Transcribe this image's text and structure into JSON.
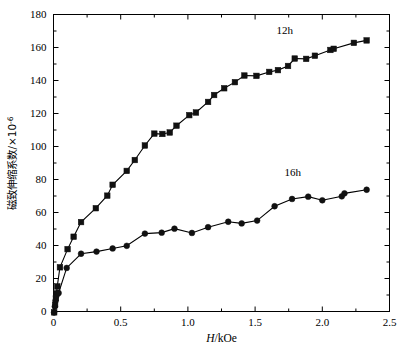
{
  "chart_data": {
    "type": "line",
    "title": "",
    "xlabel": "H/kOe",
    "ylabel": "磁致伸缩系数/×10⁻⁶",
    "ylabel_parts": {
      "cjk": "磁致伸缩系数",
      "separator": "/",
      "multiplier": "×10",
      "exponent": "-6"
    },
    "xlabel_parts": {
      "symbol": "H",
      "separator": "/",
      "unit": "kOe"
    },
    "xlim": [
      0,
      2.5
    ],
    "ylim": [
      0,
      180
    ],
    "xticks": [
      0,
      0.5,
      1.0,
      1.5,
      2.0,
      2.5
    ],
    "xtick_labels": [
      "0",
      "0.5",
      "1.0",
      "1.5",
      "2.0",
      "2.5"
    ],
    "yticks": [
      0,
      20,
      40,
      60,
      80,
      100,
      120,
      140,
      160,
      180
    ],
    "ytick_labels": [
      "0",
      "20",
      "40",
      "60",
      "80",
      "100",
      "120",
      "140",
      "160",
      "180"
    ],
    "x_minor_ticks": [
      0.25,
      0.75,
      1.25,
      1.75,
      2.25
    ],
    "y_minor_ticks": [
      10,
      30,
      50,
      70,
      90,
      110,
      130,
      150,
      170
    ],
    "grid": false,
    "legend_position": "inline-annotations",
    "series": [
      {
        "name": "12h",
        "marker": "square",
        "color": "#111111",
        "label_x": 1.72,
        "label_y": 168,
        "points": [
          [
            0.005,
            -0.5
          ],
          [
            0.012,
            4.0
          ],
          [
            0.018,
            8.0
          ],
          [
            0.022,
            11.0
          ],
          [
            0.028,
            15.2
          ],
          [
            0.048,
            26.8
          ],
          [
            0.105,
            37.8
          ],
          [
            0.15,
            45.3
          ],
          [
            0.205,
            54.2
          ],
          [
            0.315,
            62.6
          ],
          [
            0.4,
            70.2
          ],
          [
            0.44,
            76.8
          ],
          [
            0.545,
            85.2
          ],
          [
            0.605,
            91.8
          ],
          [
            0.68,
            100.6
          ],
          [
            0.75,
            107.8
          ],
          [
            0.81,
            107.6
          ],
          [
            0.865,
            108.5
          ],
          [
            0.915,
            112.6
          ],
          [
            1.01,
            119.0
          ],
          [
            1.06,
            120.6
          ],
          [
            1.15,
            127.0
          ],
          [
            1.195,
            131.2
          ],
          [
            1.27,
            135.3
          ],
          [
            1.35,
            139.0
          ],
          [
            1.42,
            143.0
          ],
          [
            1.51,
            142.8
          ],
          [
            1.605,
            145.2
          ],
          [
            1.67,
            146.3
          ],
          [
            1.745,
            148.8
          ],
          [
            1.795,
            153.3
          ],
          [
            1.88,
            153.1
          ],
          [
            1.945,
            155.0
          ],
          [
            2.06,
            158.5
          ],
          [
            2.085,
            159.2
          ],
          [
            2.235,
            162.8
          ],
          [
            2.33,
            164.3
          ]
        ]
      },
      {
        "name": "16h",
        "marker": "circle",
        "color": "#111111",
        "label_x": 1.78,
        "label_y": 82,
        "points": [
          [
            0.004,
            -0.6
          ],
          [
            0.01,
            3.0
          ],
          [
            0.015,
            6.5
          ],
          [
            0.02,
            9.2
          ],
          [
            0.03,
            11.0
          ],
          [
            0.038,
            11.2
          ],
          [
            0.098,
            26.4
          ],
          [
            0.205,
            35.0
          ],
          [
            0.32,
            36.3
          ],
          [
            0.44,
            38.2
          ],
          [
            0.545,
            39.8
          ],
          [
            0.68,
            47.2
          ],
          [
            0.805,
            47.8
          ],
          [
            0.9,
            50.2
          ],
          [
            1.03,
            47.6
          ],
          [
            1.15,
            51.1
          ],
          [
            1.3,
            54.4
          ],
          [
            1.4,
            53.4
          ],
          [
            1.515,
            55.1
          ],
          [
            1.645,
            63.8
          ],
          [
            1.775,
            68.2
          ],
          [
            1.895,
            69.6
          ],
          [
            2.0,
            67.4
          ],
          [
            2.145,
            69.8
          ],
          [
            2.165,
            71.6
          ],
          [
            2.33,
            73.8
          ]
        ]
      }
    ]
  }
}
